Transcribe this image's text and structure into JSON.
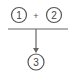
{
  "diagram": {
    "nodes": [
      {
        "id": "1",
        "label": "1"
      },
      {
        "id": "2",
        "label": "2"
      },
      {
        "id": "3",
        "label": "3"
      }
    ],
    "operator": "+",
    "edges": [
      {
        "from": [
          "1",
          "2"
        ],
        "to": "3",
        "type": "combine-arrow"
      }
    ],
    "colors": {
      "stroke": "#555555",
      "text": "#444444"
    }
  }
}
